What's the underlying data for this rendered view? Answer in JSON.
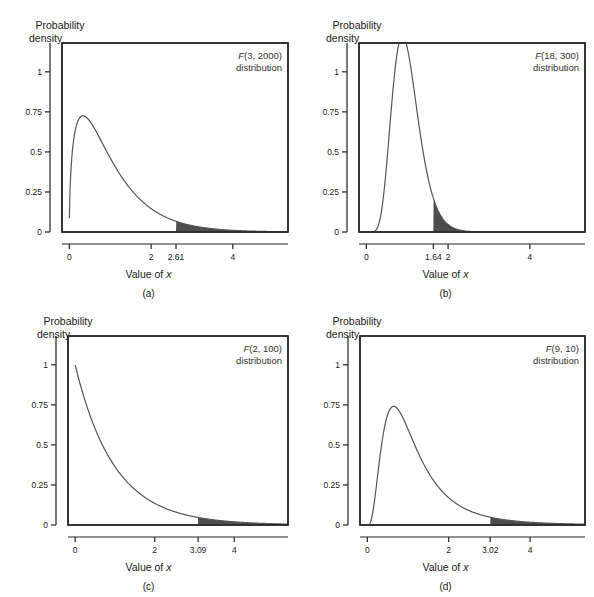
{
  "figure": {
    "axis": {
      "y_title_line1": "Probability",
      "y_title_line2": "density",
      "x_title_prefix": "Value of ",
      "x_title_var": "x"
    },
    "style": {
      "curve_color": "#555555",
      "frame_color": "#222222",
      "shade_color": "#4d4d4d",
      "text_color": "#1a1a1a",
      "label_color": "#333333",
      "background": "#ffffff"
    }
  },
  "chart_data": [
    {
      "type": "line",
      "panel": "(a)",
      "title": "F(3, 2000) distribution",
      "dist_letter": "F",
      "dist_params": "(3, 2000)",
      "dist_sub": "distribution",
      "df1": 3,
      "df2": 2000,
      "xlabel": "Value of x",
      "ylabel": "Probability density",
      "xlim": [
        -0.18,
        5.35
      ],
      "ylim": [
        0,
        1.18
      ],
      "xticks": [
        0,
        2,
        4
      ],
      "xticklabels": [
        "0",
        "2",
        "4"
      ],
      "extra_xticks": [
        2.61
      ],
      "extra_xticklabels": [
        "2.61"
      ],
      "yticks": [
        0,
        0.25,
        0.5,
        0.75,
        1
      ],
      "yticklabels": [
        "0",
        "0.25",
        "0.5",
        "0.75",
        "1"
      ],
      "critical_value": 2.61,
      "shaded_region": "upper tail from 2.61",
      "peak_x": 0.33,
      "peak_y": 0.72,
      "grid": false,
      "legend": "inside top-right"
    },
    {
      "type": "line",
      "panel": "(b)",
      "title": "F(18, 300) distribution",
      "dist_letter": "F",
      "dist_params": "(18, 300)",
      "dist_sub": "distribution",
      "df1": 18,
      "df2": 300,
      "xlabel": "Value of x",
      "ylabel": "Probability density",
      "xlim": [
        -0.18,
        5.35
      ],
      "ylim": [
        0,
        1.18
      ],
      "xticks": [
        0,
        2,
        4
      ],
      "xticklabels": [
        "0",
        "2",
        "4"
      ],
      "extra_xticks": [
        1.64
      ],
      "extra_xticklabels": [
        "1.64"
      ],
      "yticks": [
        0,
        0.25,
        0.5,
        0.75,
        1
      ],
      "yticklabels": [
        "0",
        "0.25",
        "0.5",
        "0.75",
        "1"
      ],
      "critical_value": 1.64,
      "shaded_region": "upper tail from 1.64",
      "peak_x": 0.92,
      "peak_y": 1.23,
      "grid": false,
      "legend": "inside top-right"
    },
    {
      "type": "line",
      "panel": "(c)",
      "title": "F(2, 100) distribution",
      "dist_letter": "F",
      "dist_params": "(2, 100)",
      "dist_sub": "distribution",
      "df1": 2,
      "df2": 100,
      "xlabel": "Value of x",
      "ylabel": "Probability density",
      "xlim": [
        -0.18,
        5.35
      ],
      "ylim": [
        0,
        1.18
      ],
      "xticks": [
        0,
        2,
        4
      ],
      "xticklabels": [
        "0",
        "2",
        "4"
      ],
      "extra_xticks": [
        3.09
      ],
      "extra_xticklabels": [
        "3.09"
      ],
      "yticks": [
        0,
        0.25,
        0.5,
        0.75,
        1
      ],
      "yticklabels": [
        "0",
        "0.25",
        "0.5",
        "0.75",
        "1"
      ],
      "critical_value": 3.09,
      "shaded_region": "upper tail from 3.09",
      "peak_x": 0,
      "peak_y": 1.0,
      "grid": false,
      "legend": "inside top-right"
    },
    {
      "type": "line",
      "panel": "(d)",
      "title": "F(9, 10) distribution",
      "dist_letter": "F",
      "dist_params": "(9, 10)",
      "dist_sub": "distribution",
      "df1": 9,
      "df2": 10,
      "xlabel": "Value of x",
      "ylabel": "Probability density",
      "xlim": [
        -0.18,
        5.35
      ],
      "ylim": [
        0,
        1.18
      ],
      "xticks": [
        0,
        2,
        4
      ],
      "xticklabels": [
        "0",
        "2",
        "4"
      ],
      "extra_xticks": [
        3.02
      ],
      "extra_xticklabels": [
        "3.02"
      ],
      "yticks": [
        0,
        0.25,
        0.5,
        0.75,
        1
      ],
      "yticklabels": [
        "0",
        "0.25",
        "0.5",
        "0.75",
        "1"
      ],
      "critical_value": 3.02,
      "shaded_region": "upper tail from 3.02",
      "peak_x": 0.72,
      "peak_y": 0.745,
      "grid": false,
      "legend": "inside top-right"
    }
  ]
}
